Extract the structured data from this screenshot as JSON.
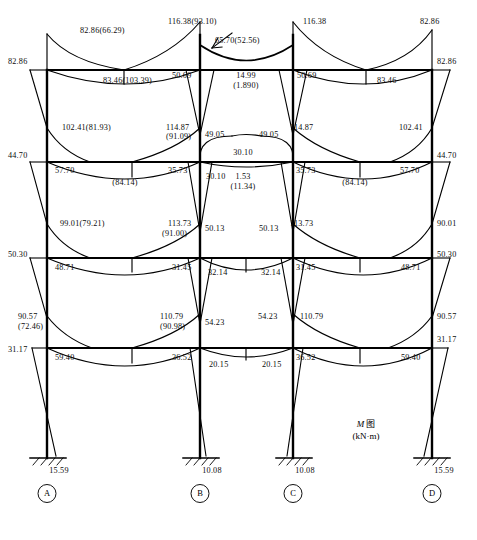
{
  "figure": {
    "caption_main": "M",
    "caption_suffix": "图",
    "caption_units": "(kN·m)",
    "header_text": "",
    "diagram_type": "bending-moment-diagram"
  },
  "chart_data": {
    "type": "diagram",
    "subtitle": "Bending moment diagram of a four-bay, four-storey rigid frame",
    "units": "kN·m",
    "xlabel": "",
    "ylabel": "",
    "grid": false,
    "legend": "none",
    "columns": [
      {
        "id": "A",
        "label": "A",
        "x": 47
      },
      {
        "id": "B",
        "label": "B",
        "x": 200
      },
      {
        "id": "C",
        "label": "C",
        "x": 293
      },
      {
        "id": "D",
        "label": "D",
        "x": 432
      }
    ],
    "levels": [
      {
        "id": "roof",
        "y": 70
      },
      {
        "id": "floor3",
        "y": 162
      },
      {
        "id": "floor2",
        "y": 258
      },
      {
        "id": "floor1",
        "y": 348
      },
      {
        "id": "base",
        "y": 458
      }
    ],
    "base_reactions": [
      {
        "column": "A",
        "value": "15.59"
      },
      {
        "column": "B",
        "value": "10.08"
      },
      {
        "column": "C",
        "value": "10.08"
      },
      {
        "column": "D",
        "value": "15.59"
      }
    ],
    "labels": [
      {
        "id": "r-a-top-out",
        "text": "82.86(66.29)",
        "x": 80,
        "y": 26,
        "align": "left"
      },
      {
        "id": "r-a-col",
        "text": "82.86",
        "x": 8,
        "y": 57,
        "align": "left"
      },
      {
        "id": "r-ab-span",
        "text": "83.46(103.39)",
        "x": 103,
        "y": 76,
        "align": "left"
      },
      {
        "id": "r-b-top",
        "text": "116.38(93.10)",
        "x": 168,
        "y": 17,
        "align": "left"
      },
      {
        "id": "r-bc-top",
        "text": "65.70(52.56)",
        "x": 215,
        "y": 36,
        "align": "left"
      },
      {
        "id": "r-b-left",
        "text": "50.69",
        "x": 172,
        "y": 71,
        "align": "left"
      },
      {
        "id": "r-bc-mid",
        "text": "14.99",
        "x": 246,
        "y": 71,
        "align": "center"
      },
      {
        "id": "r-bc-mid2",
        "text": "(1.890)",
        "x": 246,
        "y": 81,
        "align": "center"
      },
      {
        "id": "r-c-right",
        "text": "50.69",
        "x": 297,
        "y": 71,
        "align": "left"
      },
      {
        "id": "r-c-top",
        "text": "116.38",
        "x": 303,
        "y": 17,
        "align": "left"
      },
      {
        "id": "r-cd-span",
        "text": "83.46",
        "x": 377,
        "y": 76,
        "align": "left"
      },
      {
        "id": "r-d-top",
        "text": "82.86",
        "x": 420,
        "y": 17,
        "align": "left"
      },
      {
        "id": "r-d-col",
        "text": "82.86",
        "x": 437,
        "y": 57,
        "align": "left"
      },
      {
        "id": "f3-a-out",
        "text": "102.41(81.93)",
        "x": 62,
        "y": 123,
        "align": "left"
      },
      {
        "id": "f3-a-col",
        "text": "44.70",
        "x": 8,
        "y": 151,
        "align": "left"
      },
      {
        "id": "f3-a-beam",
        "text": "57.70",
        "x": 55,
        "y": 166,
        "align": "left"
      },
      {
        "id": "f3-ab-span",
        "text": "(84.14)",
        "x": 125,
        "y": 178,
        "align": "center"
      },
      {
        "id": "f3-b-out",
        "text": "114.87",
        "x": 166,
        "y": 123,
        "align": "left"
      },
      {
        "id": "f3-b-out2",
        "text": "(91.09)",
        "x": 166,
        "y": 132,
        "align": "left"
      },
      {
        "id": "f3-b-right",
        "text": "49.05",
        "x": 205,
        "y": 130,
        "align": "left"
      },
      {
        "id": "f3-c-left",
        "text": "49.05",
        "x": 259,
        "y": 130,
        "align": "left"
      },
      {
        "id": "f3-c-out",
        "text": "114.87",
        "x": 290,
        "y": 123,
        "align": "left"
      },
      {
        "id": "f3-b-beam",
        "text": "35.73",
        "x": 168,
        "y": 166,
        "align": "left"
      },
      {
        "id": "f3-bc-l",
        "text": "30.10",
        "x": 206,
        "y": 172,
        "align": "left"
      },
      {
        "id": "f3-bc-top",
        "text": "30.10",
        "x": 243,
        "y": 148,
        "align": "center"
      },
      {
        "id": "f3-bc-mid",
        "text": "1.53",
        "x": 243,
        "y": 172,
        "align": "center"
      },
      {
        "id": "f3-bc-mid2",
        "text": "(11.34)",
        "x": 243,
        "y": 182,
        "align": "center"
      },
      {
        "id": "f3-c-beam",
        "text": "35.73",
        "x": 296,
        "y": 166,
        "align": "left"
      },
      {
        "id": "f3-cd-span",
        "text": "(84.14)",
        "x": 355,
        "y": 178,
        "align": "center"
      },
      {
        "id": "f3-d-out",
        "text": "102.41",
        "x": 399,
        "y": 123,
        "align": "left"
      },
      {
        "id": "f3-d-col",
        "text": "44.70",
        "x": 437,
        "y": 151,
        "align": "left"
      },
      {
        "id": "f3-d-beam",
        "text": "57.70",
        "x": 400,
        "y": 166,
        "align": "left"
      },
      {
        "id": "f2-a-out",
        "text": "99.01(79.21)",
        "x": 60,
        "y": 219,
        "align": "left"
      },
      {
        "id": "f2-a-col",
        "text": "50.30",
        "x": 8,
        "y": 250,
        "align": "left"
      },
      {
        "id": "f2-a-beam",
        "text": "48.71",
        "x": 55,
        "y": 263,
        "align": "left"
      },
      {
        "id": "f2-b-out",
        "text": "113.73",
        "x": 168,
        "y": 219,
        "align": "left"
      },
      {
        "id": "f2-b-out2",
        "text": "(91.00)",
        "x": 162,
        "y": 229,
        "align": "left"
      },
      {
        "id": "f2-b-right",
        "text": "50.13",
        "x": 205,
        "y": 224,
        "align": "left"
      },
      {
        "id": "f2-c-left",
        "text": "50.13",
        "x": 259,
        "y": 224,
        "align": "left"
      },
      {
        "id": "f2-c-out",
        "text": "113.73",
        "x": 290,
        "y": 219,
        "align": "left"
      },
      {
        "id": "f2-b-beam",
        "text": "31.45",
        "x": 172,
        "y": 263,
        "align": "left"
      },
      {
        "id": "f2-bc-l",
        "text": "32.14",
        "x": 208,
        "y": 268,
        "align": "left"
      },
      {
        "id": "f2-bc-r",
        "text": "32.14",
        "x": 261,
        "y": 268,
        "align": "left"
      },
      {
        "id": "f2-c-beam",
        "text": "31.45",
        "x": 296,
        "y": 263,
        "align": "left"
      },
      {
        "id": "f2-d-out",
        "text": "90.01",
        "x": 437,
        "y": 219,
        "align": "left"
      },
      {
        "id": "f2-d-col",
        "text": "50.30",
        "x": 437,
        "y": 250,
        "align": "left"
      },
      {
        "id": "f2-d-beam",
        "text": "48.71",
        "x": 401,
        "y": 263,
        "align": "left"
      },
      {
        "id": "f1-a-out",
        "text": "90.57",
        "x": 18,
        "y": 312,
        "align": "left"
      },
      {
        "id": "f1-a-out2",
        "text": "(72.46)",
        "x": 18,
        "y": 322,
        "align": "left"
      },
      {
        "id": "f1-a-col",
        "text": "31.17",
        "x": 8,
        "y": 345,
        "align": "left"
      },
      {
        "id": "f1-a-beam",
        "text": "59.40",
        "x": 55,
        "y": 353,
        "align": "left"
      },
      {
        "id": "f1-b-out",
        "text": "110.79",
        "x": 160,
        "y": 312,
        "align": "left"
      },
      {
        "id": "f1-b-out2",
        "text": "(90.98)",
        "x": 160,
        "y": 322,
        "align": "left"
      },
      {
        "id": "f1-b-right",
        "text": "54.23",
        "x": 205,
        "y": 318,
        "align": "left"
      },
      {
        "id": "f1-c-left",
        "text": "54.23",
        "x": 258,
        "y": 312,
        "align": "left"
      },
      {
        "id": "f1-c-out",
        "text": "110.79",
        "x": 300,
        "y": 312,
        "align": "left"
      },
      {
        "id": "f1-b-beam",
        "text": "36.52",
        "x": 172,
        "y": 353,
        "align": "left"
      },
      {
        "id": "f1-bc-l",
        "text": "20.15",
        "x": 209,
        "y": 360,
        "align": "left"
      },
      {
        "id": "f1-bc-r",
        "text": "20.15",
        "x": 262,
        "y": 360,
        "align": "left"
      },
      {
        "id": "f1-c-beam",
        "text": "36.52",
        "x": 296,
        "y": 353,
        "align": "left"
      },
      {
        "id": "f1-d-out",
        "text": "90.57",
        "x": 437,
        "y": 312,
        "align": "left"
      },
      {
        "id": "f1-d-col",
        "text": "31.17",
        "x": 437,
        "y": 335,
        "align": "left"
      },
      {
        "id": "f1-d-beam",
        "text": "59.40",
        "x": 401,
        "y": 353,
        "align": "left"
      }
    ]
  }
}
